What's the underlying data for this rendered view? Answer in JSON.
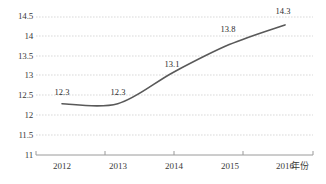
{
  "chart_data": {
    "type": "line",
    "title": "",
    "subtitle": "",
    "xlabel": "年份",
    "ylabel": "",
    "categories": [
      "2012",
      "2013",
      "2014",
      "2015",
      "2016"
    ],
    "x": [
      2012,
      2013,
      2014,
      2015,
      2016
    ],
    "values": [
      12.3,
      12.3,
      13.1,
      13.8,
      14.3
    ],
    "data_labels": [
      "12.3",
      "12.3",
      "13.1",
      "13.8",
      "14.3"
    ],
    "ylim": [
      11,
      14.5
    ],
    "y_ticks": [
      "14.5",
      "14",
      "13.5",
      "13",
      "12.5",
      "12",
      "11.5",
      "11"
    ],
    "y_tick_values": [
      14.5,
      14,
      13.5,
      13,
      12.5,
      12,
      11.5,
      11
    ],
    "grid": "horizontal-dotted",
    "legend": "none",
    "markers": "none",
    "smoothing": "spline",
    "series": [
      {
        "name": "",
        "values": [
          12.3,
          12.3,
          13.1,
          13.8,
          14.3
        ]
      }
    ],
    "colors": {
      "line": "#595959",
      "gridline": "#d9d9d9",
      "axis": "#808080",
      "text": "#3a3a3a",
      "background": "#ffffff"
    }
  }
}
